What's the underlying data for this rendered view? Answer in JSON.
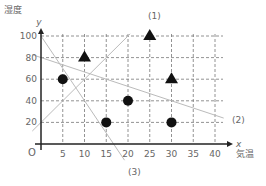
{
  "chart_data": {
    "type": "scatter",
    "title": "",
    "xlabel": "気温",
    "ylabel": "湿度",
    "x_axis_letter": "x",
    "y_axis_letter": "y",
    "origin_label": "O",
    "xlim": [
      0,
      42
    ],
    "ylim": [
      0,
      105
    ],
    "x_ticks": [
      5,
      10,
      15,
      20,
      25,
      30,
      35,
      40
    ],
    "y_ticks": [
      20,
      40,
      60,
      80,
      100
    ],
    "grid": true,
    "series": [
      {
        "name": "circle",
        "marker": "circle",
        "points": [
          [
            5,
            60
          ],
          [
            15,
            20
          ],
          [
            20,
            40
          ],
          [
            30,
            20
          ]
        ]
      },
      {
        "name": "triangle",
        "marker": "triangle",
        "points": [
          [
            10,
            80
          ],
          [
            25,
            100
          ],
          [
            30,
            60
          ]
        ]
      }
    ],
    "lines": [
      {
        "label": "(1)",
        "from": [
          -2,
          12
        ],
        "to": [
          20.5,
          102
        ]
      },
      {
        "label": "(2)",
        "from": [
          -2,
          82.7
        ],
        "to": [
          42,
          24
        ]
      },
      {
        "label": "(3)",
        "from": [
          0,
          100
        ],
        "to": [
          19.2,
          -15
        ]
      }
    ]
  }
}
